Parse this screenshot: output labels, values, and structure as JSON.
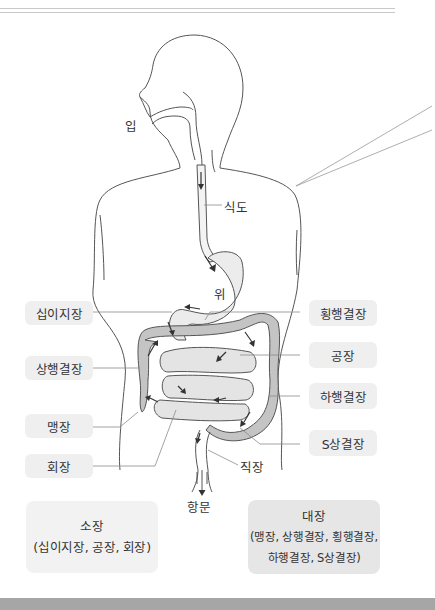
{
  "diagram": {
    "organs": {
      "mouth": "입",
      "esophagus": "식도",
      "stomach": "위",
      "rectum": "직장",
      "anus": "항문"
    },
    "left_labels": [
      {
        "id": "duodenum",
        "label": "십이지장"
      },
      {
        "id": "ascending-colon",
        "label": "상행결장"
      },
      {
        "id": "cecum",
        "label": "맹장"
      },
      {
        "id": "ileum",
        "label": "회장"
      }
    ],
    "right_labels": [
      {
        "id": "transverse-colon",
        "label": "횡행결장"
      },
      {
        "id": "jejunum",
        "label": "공장"
      },
      {
        "id": "descending-colon",
        "label": "하행결장"
      },
      {
        "id": "sigmoid-colon",
        "label": "S상결장"
      }
    ],
    "groups": {
      "small_intestine": {
        "title": "소장",
        "members": "(십이지장, 공장, 회장)"
      },
      "large_intestine": {
        "title": "대장",
        "members_line1": "(맹장, 상행결장, 횡행결장,",
        "members_line2": "하행결장, S상결장)"
      }
    },
    "colors": {
      "outline": "#555555",
      "organ_fill": "#ececec",
      "colon_fill": "#c4c4c4",
      "small_fill": "#e4e4e4",
      "label_bg": "#efefef",
      "leader_line": "#8c8c8c",
      "bottom_bar": "#a6a6a6"
    }
  }
}
